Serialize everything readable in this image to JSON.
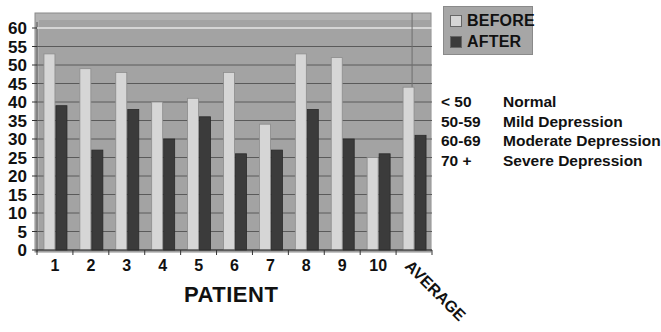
{
  "chart_data": {
    "type": "bar",
    "title": "",
    "xlabel": "PATIENT",
    "ylabel": "",
    "categories": [
      "1",
      "2",
      "3",
      "4",
      "5",
      "6",
      "7",
      "8",
      "9",
      "10",
      "AVERAGE"
    ],
    "series": [
      {
        "name": "BEFORE",
        "color": "#d6d6d6",
        "values": [
          53,
          49,
          48,
          40,
          41,
          48,
          34,
          53,
          52,
          25,
          44
        ]
      },
      {
        "name": "AFTER",
        "color": "#3b3b3b",
        "values": [
          39,
          27,
          38,
          30,
          36,
          26,
          27,
          38,
          30,
          26,
          31
        ]
      }
    ],
    "ylim": [
      0,
      60
    ],
    "yticks": [
      0,
      5,
      10,
      15,
      20,
      25,
      30,
      35,
      40,
      45,
      50,
      55,
      60
    ],
    "grid": true,
    "legend_position": "top-right",
    "annotations": [
      {
        "range": "< 50",
        "label": "Normal"
      },
      {
        "range": "50-59",
        "label": "Mild Depression"
      },
      {
        "range": "60-69",
        "label": "Moderate Depression"
      },
      {
        "range": "70 +",
        "label": "Severe Depression"
      }
    ]
  },
  "legend": {
    "items": [
      {
        "label": "BEFORE",
        "color": "#d6d6d6"
      },
      {
        "label": "AFTER",
        "color": "#3b3b3b"
      }
    ]
  },
  "scale": {
    "rows": [
      {
        "range": "< 50",
        "label": "Normal"
      },
      {
        "range": "50-59",
        "label": "Mild Depression"
      },
      {
        "range": "60-69",
        "label": "Moderate Depression"
      },
      {
        "range": "70 +",
        "label": "Severe Depression"
      }
    ]
  },
  "axis": {
    "xlabel": "PATIENT"
  },
  "colors": {
    "plot_bg": "#a3a3a3",
    "gridline": "#5a5a5a",
    "before": "#d6d6d6",
    "after": "#3b3b3b"
  }
}
